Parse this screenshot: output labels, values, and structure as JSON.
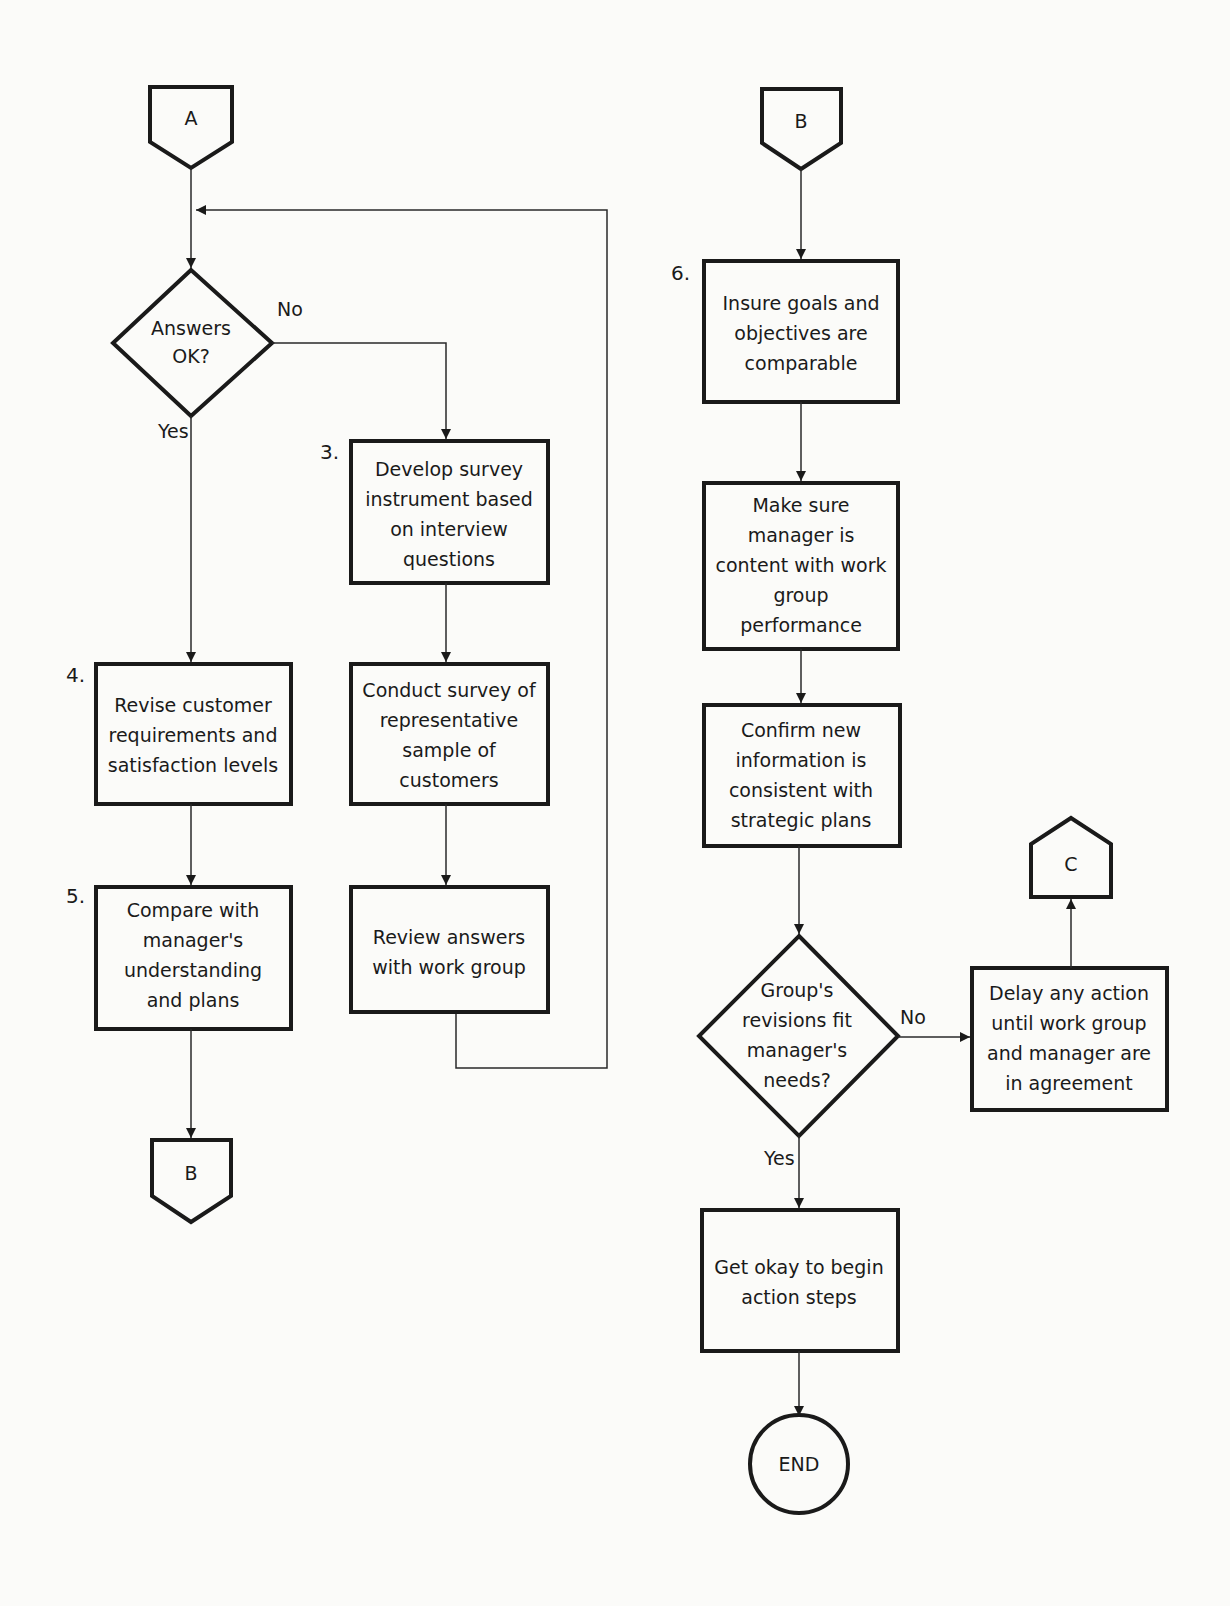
{
  "connectors": {
    "a_top": "A",
    "b_bottom_left": "B",
    "b_top_right": "B",
    "c_right": "C"
  },
  "decisions": {
    "answers_ok": {
      "lines": [
        "Answers",
        "OK?"
      ],
      "yes": "Yes",
      "no": "No"
    },
    "revisions_fit": {
      "lines": [
        "Group's",
        "revisions fit",
        "manager's",
        "needs?"
      ],
      "yes": "Yes",
      "no": "No"
    }
  },
  "steps": {
    "s3": {
      "number": "3.",
      "lines": [
        "Develop survey",
        "instrument based",
        "on interview",
        "questions"
      ]
    },
    "conduct": {
      "lines": [
        "Conduct survey of",
        "representative",
        "sample of",
        "customers"
      ]
    },
    "review": {
      "lines": [
        "Review answers",
        "with work group"
      ]
    },
    "s4": {
      "number": "4.",
      "lines": [
        "Revise customer",
        "requirements and",
        "satisfaction levels"
      ]
    },
    "s5": {
      "number": "5.",
      "lines": [
        "Compare with",
        "manager's",
        "understanding",
        "and plans"
      ]
    },
    "s6": {
      "number": "6.",
      "lines": [
        "Insure goals and",
        "objectives are",
        "comparable"
      ]
    },
    "content": {
      "lines": [
        "Make sure",
        "manager is",
        "content with work",
        "group",
        "performance"
      ]
    },
    "confirm": {
      "lines": [
        "Confirm new",
        "information is",
        "consistent with",
        "strategic plans"
      ]
    },
    "delay": {
      "lines": [
        "Delay any action",
        "until work group",
        "and manager are",
        "in agreement"
      ]
    },
    "okay": {
      "lines": [
        "Get okay to begin",
        "action steps"
      ]
    }
  },
  "terminal": {
    "end": "END"
  }
}
